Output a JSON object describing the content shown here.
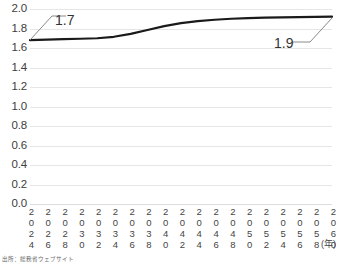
{
  "chart_data": {
    "type": "line",
    "title": "",
    "xlabel": "(年)",
    "ylabel": "",
    "ylim": [
      0.0,
      2.0
    ],
    "ytick_step": 0.2,
    "grid": true,
    "legend": "none",
    "x_unit_label": "(年)",
    "categories": [
      "2024",
      "2026",
      "2028",
      "2030",
      "2032",
      "2034",
      "2036",
      "2038",
      "2040",
      "2042",
      "2044",
      "2046",
      "2048",
      "2050",
      "2052",
      "2054",
      "2056",
      "2058",
      "2060"
    ],
    "y_ticks": [
      "2.0",
      "1.8",
      "1.6",
      "1.4",
      "1.2",
      "1.0",
      "0.8",
      "0.6",
      "0.4",
      "0.2",
      "0.0"
    ],
    "series": [
      {
        "name": "値",
        "color": "#1a1a1a",
        "values": [
          1.68,
          1.685,
          1.69,
          1.695,
          1.7,
          1.715,
          1.745,
          1.785,
          1.825,
          1.855,
          1.875,
          1.89,
          1.9,
          1.906,
          1.911,
          1.914,
          1.917,
          1.919,
          1.921
        ]
      }
    ],
    "annotations": [
      {
        "name": "start-value",
        "text": "1.7",
        "points_to_year": "2024",
        "value": 1.7
      },
      {
        "name": "end-value",
        "text": "1.9",
        "points_to_year": "2060",
        "value": 1.9
      }
    ],
    "colors": {
      "line": "#1a1a1a",
      "gridline": "#e6e6e6",
      "baseline": "#dddddd",
      "text": "#404040",
      "background": "#ffffff"
    }
  },
  "footer": {
    "source_note": "出所：総務省ウェブサイト"
  }
}
